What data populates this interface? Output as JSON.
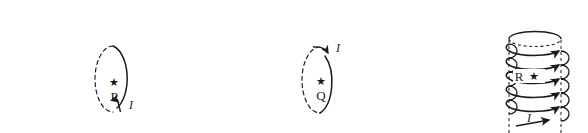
{
  "figure": {
    "background_color": "#ffffff",
    "stroke_color": "#1a1a1a",
    "width": 588,
    "height": 133,
    "panels": [
      {
        "id": "panel-p",
        "type": "current-loop",
        "point_label": "P",
        "marker_glyph": "★",
        "current_label": "I",
        "current_direction": "counterclockwise-upward-on-right",
        "arrow_position": "bottom-right",
        "loop_dashed_side": "left",
        "loop_solid_side": "right"
      },
      {
        "id": "panel-q",
        "type": "current-loop",
        "point_label": "Q",
        "marker_glyph": "★",
        "current_label": "I",
        "current_direction": "clockwise-downward-on-right",
        "arrow_position": "top-right",
        "loop_dashed_side": "left",
        "loop_solid_side": "right"
      },
      {
        "id": "panel-r",
        "type": "solenoid",
        "point_label": "R",
        "marker_glyph": "★",
        "current_label": "I",
        "turns": 5,
        "top_cap_style": "dashed-ellipse",
        "axis_style": "dashed-vertical",
        "arrow_position": "bottom-center"
      }
    ]
  }
}
